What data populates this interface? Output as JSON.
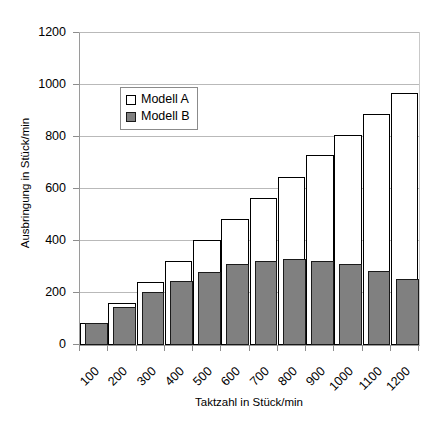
{
  "chart_data": {
    "type": "bar",
    "title": "",
    "subtitle": "",
    "xlabel": "Taktzahl in Stück/min",
    "ylabel": "Ausbringung in Stück/min",
    "categories": [
      "100",
      "200",
      "300",
      "400",
      "500",
      "600",
      "700",
      "800",
      "900",
      "1000",
      "1100",
      "1200"
    ],
    "series": [
      {
        "name": "Modell A",
        "color": "#ffffff",
        "edge_color": "#000000",
        "values": [
          85,
          160,
          243,
          323,
          405,
          485,
          567,
          645,
          730,
          808,
          890,
          968
        ]
      },
      {
        "name": "Modell B",
        "color": "#808080",
        "edge_color": "#1a1a1a",
        "values": [
          85,
          148,
          203,
          245,
          281,
          310,
          323,
          330,
          325,
          313,
          285,
          252
        ]
      }
    ],
    "ylim": [
      0,
      1200
    ],
    "yticks": [
      0,
      200,
      400,
      600,
      800,
      1000,
      1200
    ],
    "ytick_labels": [
      "0",
      "200",
      "400",
      "600",
      "800",
      "1000",
      "1200"
    ],
    "grid": "horizontal",
    "legend_position": "upper-left-inside",
    "bar_style": "overlapping",
    "xtick_label_rotation": -45
  },
  "legend": {
    "entries": [
      {
        "label": "Modell A",
        "swatch": "hollow-square-icon"
      },
      {
        "label": "Modell B",
        "swatch": "filled-square-icon"
      }
    ]
  },
  "colors": {
    "series_b_fill": "#808080",
    "series_a_fill": "#ffffff",
    "outline": "#000000",
    "gridline": "#b9b9b9",
    "axis": "#8d8d8d",
    "background": "#ffffff"
  }
}
